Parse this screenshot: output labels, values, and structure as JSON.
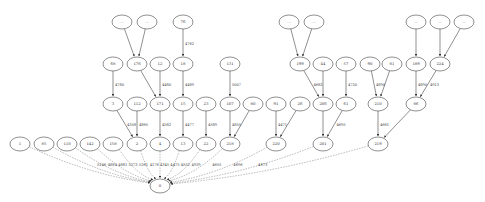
{
  "colors": {
    "stroke": "#444444",
    "fill": "#ffffff",
    "text": "#333333",
    "dashed": "#888888"
  },
  "nodes": [
    {
      "id": "e1",
      "label": "...",
      "x": 122,
      "y": 22
    },
    {
      "id": "e2",
      "label": "...",
      "x": 147,
      "y": 22
    },
    {
      "id": "n76",
      "label": "76",
      "x": 183,
      "y": 22
    },
    {
      "id": "e3",
      "label": "...",
      "x": 289,
      "y": 22
    },
    {
      "id": "e4",
      "label": "...",
      "x": 314,
      "y": 22
    },
    {
      "id": "e5",
      "label": "...",
      "x": 416,
      "y": 22
    },
    {
      "id": "e6",
      "label": "...",
      "x": 440,
      "y": 22
    },
    {
      "id": "e7",
      "label": "...",
      "x": 464,
      "y": 22
    },
    {
      "id": "n68",
      "label": "68",
      "x": 113,
      "y": 64
    },
    {
      "id": "n176",
      "label": "176",
      "x": 137,
      "y": 64
    },
    {
      "id": "n12",
      "label": "12",
      "x": 160,
      "y": 64
    },
    {
      "id": "n18",
      "label": "18",
      "x": 183,
      "y": 64
    },
    {
      "id": "n131",
      "label": "131",
      "x": 230,
      "y": 64
    },
    {
      "id": "n199",
      "label": "199",
      "x": 300,
      "y": 64
    },
    {
      "id": "n44",
      "label": "44",
      "x": 323,
      "y": 64
    },
    {
      "id": "n57",
      "label": "57",
      "x": 346,
      "y": 64
    },
    {
      "id": "n90",
      "label": "90",
      "x": 370,
      "y": 64
    },
    {
      "id": "n81",
      "label": "81",
      "x": 392,
      "y": 64
    },
    {
      "id": "n189",
      "label": "189",
      "x": 416,
      "y": 64
    },
    {
      "id": "n224",
      "label": "224",
      "x": 440,
      "y": 64
    },
    {
      "id": "n3",
      "label": "3",
      "x": 113,
      "y": 104
    },
    {
      "id": "n112",
      "label": "112",
      "x": 137,
      "y": 104
    },
    {
      "id": "n171",
      "label": "171",
      "x": 160,
      "y": 104
    },
    {
      "id": "n15",
      "label": "15",
      "x": 183,
      "y": 104
    },
    {
      "id": "n23",
      "label": "23",
      "x": 206,
      "y": 104
    },
    {
      "id": "n107",
      "label": "107",
      "x": 230,
      "y": 104
    },
    {
      "id": "n80",
      "label": "80",
      "x": 253,
      "y": 104
    },
    {
      "id": "n91",
      "label": "91",
      "x": 276,
      "y": 104
    },
    {
      "id": "n26",
      "label": "26",
      "x": 300,
      "y": 104
    },
    {
      "id": "n206",
      "label": "206",
      "x": 323,
      "y": 104
    },
    {
      "id": "n61",
      "label": "61",
      "x": 346,
      "y": 104
    },
    {
      "id": "n210",
      "label": "210",
      "x": 378,
      "y": 104
    },
    {
      "id": "n86",
      "label": "86",
      "x": 416,
      "y": 104
    },
    {
      "id": "n1",
      "label": "1",
      "x": 20,
      "y": 144
    },
    {
      "id": "n85",
      "label": "85",
      "x": 44,
      "y": 144
    },
    {
      "id": "n110",
      "label": "110",
      "x": 67,
      "y": 144
    },
    {
      "id": "n142",
      "label": "142",
      "x": 90,
      "y": 144
    },
    {
      "id": "n158",
      "label": "158",
      "x": 113,
      "y": 144
    },
    {
      "id": "n2",
      "label": "2",
      "x": 137,
      "y": 144
    },
    {
      "id": "n4",
      "label": "4",
      "x": 160,
      "y": 144
    },
    {
      "id": "n13",
      "label": "13",
      "x": 183,
      "y": 144
    },
    {
      "id": "n22",
      "label": "22",
      "x": 206,
      "y": 144
    },
    {
      "id": "n218",
      "label": "218",
      "x": 230,
      "y": 144
    },
    {
      "id": "n220",
      "label": "220",
      "x": 276,
      "y": 144
    },
    {
      "id": "n201",
      "label": "201",
      "x": 323,
      "y": 144
    },
    {
      "id": "n219",
      "label": "219",
      "x": 378,
      "y": 144
    },
    {
      "id": "n0",
      "label": "0",
      "x": 160,
      "y": 186
    }
  ],
  "edges": [
    {
      "from": "e1",
      "to": "n176",
      "label": "",
      "style": "solid"
    },
    {
      "from": "e2",
      "to": "n176",
      "label": "",
      "style": "solid"
    },
    {
      "from": "n76",
      "to": "n18",
      "label": "4762",
      "style": "solid"
    },
    {
      "from": "e3",
      "to": "n199",
      "label": "",
      "style": "solid"
    },
    {
      "from": "e4",
      "to": "n199",
      "label": "",
      "style": "solid"
    },
    {
      "from": "e5",
      "to": "n189",
      "label": "",
      "style": "solid"
    },
    {
      "from": "e6",
      "to": "n224",
      "label": "",
      "style": "solid"
    },
    {
      "from": "e7",
      "to": "n224",
      "label": "",
      "style": "solid"
    },
    {
      "from": "n68",
      "to": "n3",
      "label": "4780",
      "style": "solid"
    },
    {
      "from": "n176",
      "to": "n171",
      "label": "",
      "style": "solid"
    },
    {
      "from": "n12",
      "to": "n171",
      "label": "4480",
      "style": "solid"
    },
    {
      "from": "n18",
      "to": "n15",
      "label": "4489",
      "style": "solid"
    },
    {
      "from": "n131",
      "to": "n107",
      "label": "5007",
      "style": "solid"
    },
    {
      "from": "n199",
      "to": "n206",
      "label": "4682",
      "style": "solid"
    },
    {
      "from": "n44",
      "to": "n206",
      "label": "",
      "style": "solid"
    },
    {
      "from": "n57",
      "to": "n61",
      "label": "4720",
      "style": "solid"
    },
    {
      "from": "n90",
      "to": "n210",
      "label": "4890",
      "style": "solid"
    },
    {
      "from": "n81",
      "to": "n210",
      "label": "",
      "style": "solid"
    },
    {
      "from": "n189",
      "to": "n86",
      "label": "4890",
      "style": "solid"
    },
    {
      "from": "n224",
      "to": "n86",
      "label": "4913",
      "style": "solid"
    },
    {
      "from": "n3",
      "to": "n2",
      "label": "4358",
      "style": "solid"
    },
    {
      "from": "n112",
      "to": "n2",
      "label": "4865",
      "style": "solid"
    },
    {
      "from": "n171",
      "to": "n4",
      "label": "4582",
      "style": "solid"
    },
    {
      "from": "n15",
      "to": "n13",
      "label": "4477",
      "style": "solid"
    },
    {
      "from": "n23",
      "to": "n22",
      "label": "4589",
      "style": "solid"
    },
    {
      "from": "n107",
      "to": "n218",
      "label": "4855",
      "style": "solid"
    },
    {
      "from": "n80",
      "to": "n218",
      "label": "",
      "style": "solid"
    },
    {
      "from": "n91",
      "to": "n220",
      "label": "4471",
      "style": "solid"
    },
    {
      "from": "n26",
      "to": "n220",
      "label": "",
      "style": "solid"
    },
    {
      "from": "n206",
      "to": "n201",
      "label": "",
      "style": "solid"
    },
    {
      "from": "n61",
      "to": "n201",
      "label": "4695",
      "style": "solid"
    },
    {
      "from": "n210",
      "to": "n219",
      "label": "4661",
      "style": "solid"
    },
    {
      "from": "n86",
      "to": "n219",
      "label": "",
      "style": "solid"
    },
    {
      "from": "n1",
      "to": "n0",
      "label": "5146",
      "style": "dashed"
    },
    {
      "from": "n85",
      "to": "n0",
      "label": "4884",
      "style": "dashed"
    },
    {
      "from": "n110",
      "to": "n0",
      "label": "4881",
      "style": "dashed"
    },
    {
      "from": "n142",
      "to": "n0",
      "label": "5273",
      "style": "dashed"
    },
    {
      "from": "n158",
      "to": "n0",
      "label": "5261",
      "style": "dashed"
    },
    {
      "from": "n2",
      "to": "n0",
      "label": "4176",
      "style": "dashed"
    },
    {
      "from": "n4",
      "to": "n0",
      "label": "4345",
      "style": "dashed"
    },
    {
      "from": "n13",
      "to": "n0",
      "label": "4475",
      "style": "dashed"
    },
    {
      "from": "n22",
      "to": "n0",
      "label": "4552",
      "style": "dashed"
    },
    {
      "from": "n218",
      "to": "n0",
      "label": "4939",
      "style": "dashed"
    },
    {
      "from": "n220",
      "to": "n0",
      "label": "4655",
      "style": "dashed"
    },
    {
      "from": "n201",
      "to": "n0",
      "label": "4696",
      "style": "dashed"
    },
    {
      "from": "n219",
      "to": "n0",
      "label": "4873",
      "style": "dashed"
    }
  ]
}
